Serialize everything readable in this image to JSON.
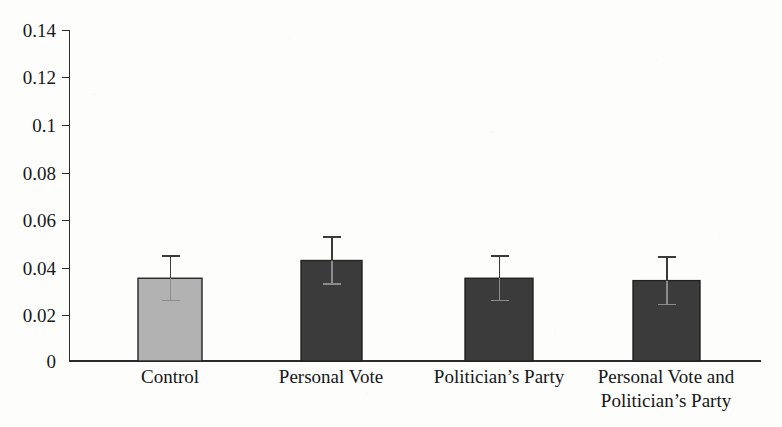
{
  "chart_data": {
    "type": "bar",
    "title": "",
    "subtitle": "",
    "xlabel": "",
    "ylabel": "",
    "categories": [
      "Control",
      "Personal Vote",
      "Politician’s Party",
      "Personal Vote and\nPolitician’s Party"
    ],
    "category_lines": [
      [
        "Control"
      ],
      [
        "Personal Vote"
      ],
      [
        "Politician’s Party"
      ],
      [
        "Personal Vote and",
        "Politician’s Party"
      ]
    ],
    "values": [
      0.035,
      0.0425,
      0.035,
      0.034
    ],
    "errors": [
      0.0095,
      0.01,
      0.0095,
      0.01
    ],
    "error_type": "symmetric",
    "ylim": [
      0,
      0.14
    ],
    "yticks": [
      0,
      0.02,
      0.04,
      0.06,
      0.08,
      0.1,
      0.12,
      0.14
    ],
    "ytick_labels": [
      "0",
      "0.02",
      "0.04",
      "0.06",
      "0.08",
      "0.1",
      "0.12",
      "0.14"
    ],
    "grid": false,
    "legend": null,
    "bar_colors": [
      "#b2b2b2",
      "#3b3b3b",
      "#3b3b3b",
      "#3b3b3b"
    ],
    "bar_edge_color": "#232323",
    "axis_color": "#2a2a2a",
    "background_color": "#fdfdfc"
  },
  "figure": {
    "name": "grouped-bar-chart",
    "axis_top_value": "0.14",
    "axis_bottom_value": "0"
  }
}
